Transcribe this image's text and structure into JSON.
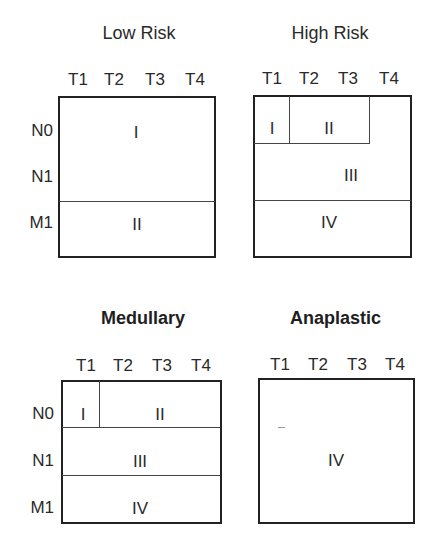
{
  "panels": {
    "low_risk": {
      "title": "Low Risk",
      "columns": [
        "T1",
        "T2",
        "T3",
        "T4"
      ],
      "rows": [
        "N0",
        "N1",
        "M1"
      ],
      "stages": [
        {
          "label": "I",
          "covers": "N0-N1, T1-T4"
        },
        {
          "label": "II",
          "covers": "M1, T1-T4"
        }
      ]
    },
    "high_risk": {
      "title": "High Risk",
      "columns": [
        "T1",
        "T2",
        "T3",
        "T4"
      ],
      "rows": [
        "N0",
        "N1",
        "M1"
      ],
      "stages": [
        {
          "label": "I",
          "covers": "N0, T1"
        },
        {
          "label": "II",
          "covers": "N0, T2-T3"
        },
        {
          "label": "III",
          "covers": "N0 T4 and N1, T1-T4"
        },
        {
          "label": "IV",
          "covers": "M1, T1-T4"
        }
      ]
    },
    "medullary": {
      "title": "Medullary",
      "columns": [
        "T1",
        "T2",
        "T3",
        "T4"
      ],
      "rows": [
        "N0",
        "N1",
        "M1"
      ],
      "stages": [
        {
          "label": "I",
          "covers": "N0, T1"
        },
        {
          "label": "II",
          "covers": "N0, T2-T4"
        },
        {
          "label": "III",
          "covers": "N1, T1-T4"
        },
        {
          "label": "IV",
          "covers": "M1, T1-T4"
        }
      ]
    },
    "anaplastic": {
      "title": "Anaplastic",
      "columns": [
        "T1",
        "T2",
        "T3",
        "T4"
      ],
      "stages": [
        {
          "label": "IV",
          "covers": "all"
        }
      ]
    }
  }
}
